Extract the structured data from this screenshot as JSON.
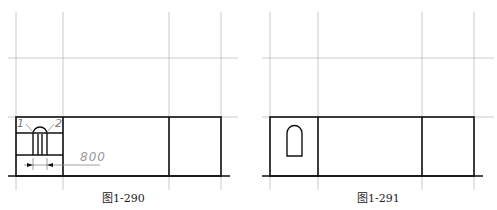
{
  "figures": [
    {
      "caption": "图1-290",
      "labels": {
        "left": "1",
        "right": "2",
        "dimension": "800"
      }
    },
    {
      "caption": "图1-291"
    }
  ],
  "colors": {
    "grid": "#b0b0b0",
    "line": "#111111",
    "dim": "#888888"
  }
}
